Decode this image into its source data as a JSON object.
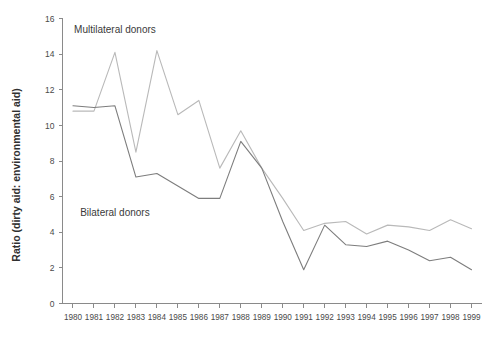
{
  "chart_data": {
    "type": "line",
    "title": "",
    "xlabel": "",
    "ylabel": "Ratio (dirty aid: environmental aid)",
    "ylim": [
      0,
      16
    ],
    "ytick_step": 2,
    "yticks": [
      "0",
      "2",
      "4",
      "6",
      "8",
      "10",
      "12",
      "14",
      "16"
    ],
    "grid": false,
    "legend_position": "inline-annotations",
    "categories": [
      "1980",
      "1981",
      "1982",
      "1983",
      "1984",
      "1985",
      "1986",
      "1987",
      "1988",
      "1989",
      "1990",
      "1991",
      "1992",
      "1993",
      "1994",
      "1995",
      "1996",
      "1997",
      "1998",
      "1999"
    ],
    "series": [
      {
        "name": "Multilateral donors",
        "color": "#b9b9b9",
        "label_x_year": "1982",
        "label_y_value": 15.2,
        "values": [
          10.8,
          10.8,
          14.1,
          8.5,
          14.2,
          10.6,
          11.4,
          7.6,
          9.7,
          7.6,
          5.9,
          4.1,
          4.5,
          4.6,
          3.9,
          4.4,
          4.3,
          4.1,
          4.7,
          4.2
        ]
      },
      {
        "name": "Bilateral donors",
        "color": "#7d7d7d",
        "label_x_year": "1982",
        "label_y_value": 4.9,
        "values": [
          11.1,
          11.0,
          11.1,
          7.1,
          7.3,
          6.6,
          5.9,
          5.9,
          9.1,
          7.6,
          4.6,
          1.9,
          4.4,
          3.3,
          3.2,
          3.5,
          3.0,
          2.4,
          2.6,
          1.9
        ]
      }
    ]
  },
  "labels": {
    "multilateral": "Multilateral donors",
    "bilateral": "Bilateral donors",
    "y_axis_title": "Ratio (dirty aid: environmental aid)"
  }
}
